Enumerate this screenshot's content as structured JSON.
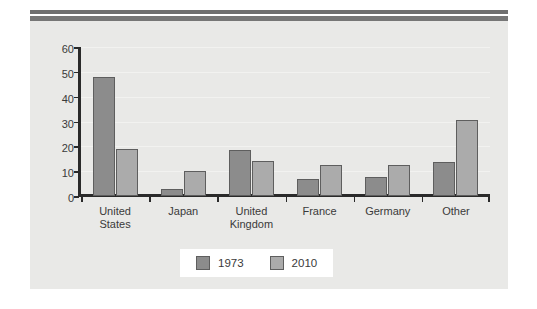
{
  "figure": {
    "background_color": "#e9e9e7",
    "rule_color": "#6f6f6f",
    "page_color": "#ffffff"
  },
  "chart_data": {
    "type": "bar",
    "title": "",
    "subtitle": "",
    "xlabel": "",
    "ylabel": "",
    "categories": [
      "United States",
      "Japan",
      "United Kingdom",
      "France",
      "Germany",
      "Other"
    ],
    "category_lines": [
      [
        "United",
        "States"
      ],
      [
        "Japan"
      ],
      [
        "United",
        "Kingdom"
      ],
      [
        "France"
      ],
      [
        "Germany"
      ],
      [
        "Other"
      ]
    ],
    "series": [
      {
        "name": "1973",
        "color": "#8c8c8c",
        "values": [
          48,
          3,
          18.5,
          7,
          7.5,
          13.5
        ]
      },
      {
        "name": "2010",
        "color": "#ababab",
        "values": [
          19,
          10,
          14,
          12.5,
          12.5,
          30.5
        ]
      }
    ],
    "ylim": [
      0,
      60
    ],
    "yticks": [
      0,
      10,
      20,
      30,
      40,
      50,
      60
    ],
    "ytick_labels": [
      "0",
      "10",
      "20",
      "30",
      "40",
      "50",
      "60"
    ],
    "grid": true,
    "legend": {
      "position": "bottom-center",
      "entries": [
        {
          "label": "1973",
          "color": "#8c8c8c"
        },
        {
          "label": "2010",
          "color": "#ababab"
        }
      ]
    }
  }
}
